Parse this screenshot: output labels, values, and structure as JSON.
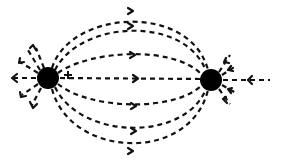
{
  "diagram": {
    "type": "electric-field-lines-dipole",
    "background": "#ffffff",
    "ink": "#111111",
    "charges": [
      {
        "id": "left-charge",
        "cx": 48,
        "cy": 78,
        "r": 11,
        "label": ""
      },
      {
        "id": "right-charge",
        "cx": 211,
        "cy": 80,
        "r": 11,
        "label": ""
      }
    ],
    "connecting_lines": [
      {
        "apex_y": 12
      },
      {
        "apex_y": 27
      },
      {
        "apex_y": 55
      },
      {
        "apex_y": 79
      },
      {
        "apex_y": 106
      },
      {
        "apex_y": 132
      },
      {
        "apex_y": 152
      }
    ],
    "plus_mark": {
      "x": 68,
      "y": 75
    },
    "left_outward_stubs": 6,
    "right_inward_stubs": 6
  }
}
